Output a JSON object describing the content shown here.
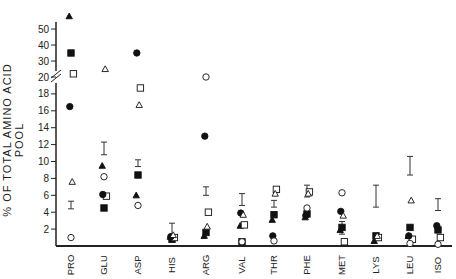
{
  "chart_data": {
    "type": "scatter",
    "title": "",
    "xlabel": "",
    "ylabel": "% OF TOTAL AMINO ACID POOL",
    "y_axis": {
      "broken": true,
      "lower_ticks": [
        2,
        4,
        6,
        8,
        10,
        12,
        14,
        16,
        18,
        20
      ],
      "upper_ticks": [
        30,
        40,
        50
      ],
      "ylim": [
        0,
        55
      ]
    },
    "categories": [
      "PRO",
      "GLU",
      "ASP",
      "HIS",
      "ARG",
      "VAL",
      "THR",
      "PHE",
      "MET",
      "LYS",
      "LEU",
      "ISO"
    ],
    "series": [
      {
        "name": "filled-triangle",
        "marker": "▲",
        "values": [
          58,
          9.5,
          6.0,
          1.1,
          1.2,
          2.4,
          3.1,
          3.4,
          1.9,
          0.6,
          1.2,
          null
        ]
      },
      {
        "name": "filled-square",
        "marker": "■",
        "values": [
          35,
          4.5,
          8.4,
          0.8,
          1.6,
          0.5,
          3.7,
          3.8,
          2.2,
          1.2,
          2.2,
          1.9
        ]
      },
      {
        "name": "open-square",
        "marker": "□",
        "values": [
          22,
          5.9,
          18.7,
          1.0,
          4.0,
          2.5,
          6.7,
          6.4,
          0.5,
          1.0,
          0.8,
          1.0
        ]
      },
      {
        "name": "filled-circle",
        "marker": "●",
        "values": [
          16.5,
          6.1,
          35,
          1.1,
          13.0,
          3.9,
          1.2,
          3.6,
          4.1,
          null,
          1.2,
          2.4
        ]
      },
      {
        "name": "open-triangle",
        "marker": "△",
        "values": [
          7.6,
          25,
          16.7,
          1.3,
          2.3,
          3.7,
          6.2,
          6.2,
          3.6,
          1.2,
          5.4,
          null
        ]
      },
      {
        "name": "open-circle",
        "marker": "○",
        "values": [
          1.0,
          8.2,
          4.8,
          null,
          20,
          0.5,
          0.6,
          4.5,
          6.3,
          null,
          0.3,
          0.2
        ]
      }
    ],
    "error_bars": {
      "name": "mean-range",
      "marker": "I",
      "low": [
        4.4,
        10.8,
        9.4,
        1.0,
        6.0,
        4.8,
        4.6,
        5.8,
        1.4,
        4.6,
        8.4,
        4.2
      ],
      "high": [
        5.3,
        12.3,
        10.2,
        2.7,
        7.0,
        6.2,
        5.4,
        7.2,
        2.9,
        7.2,
        10.6,
        5.6
      ]
    },
    "legend": "none",
    "grid": false
  }
}
